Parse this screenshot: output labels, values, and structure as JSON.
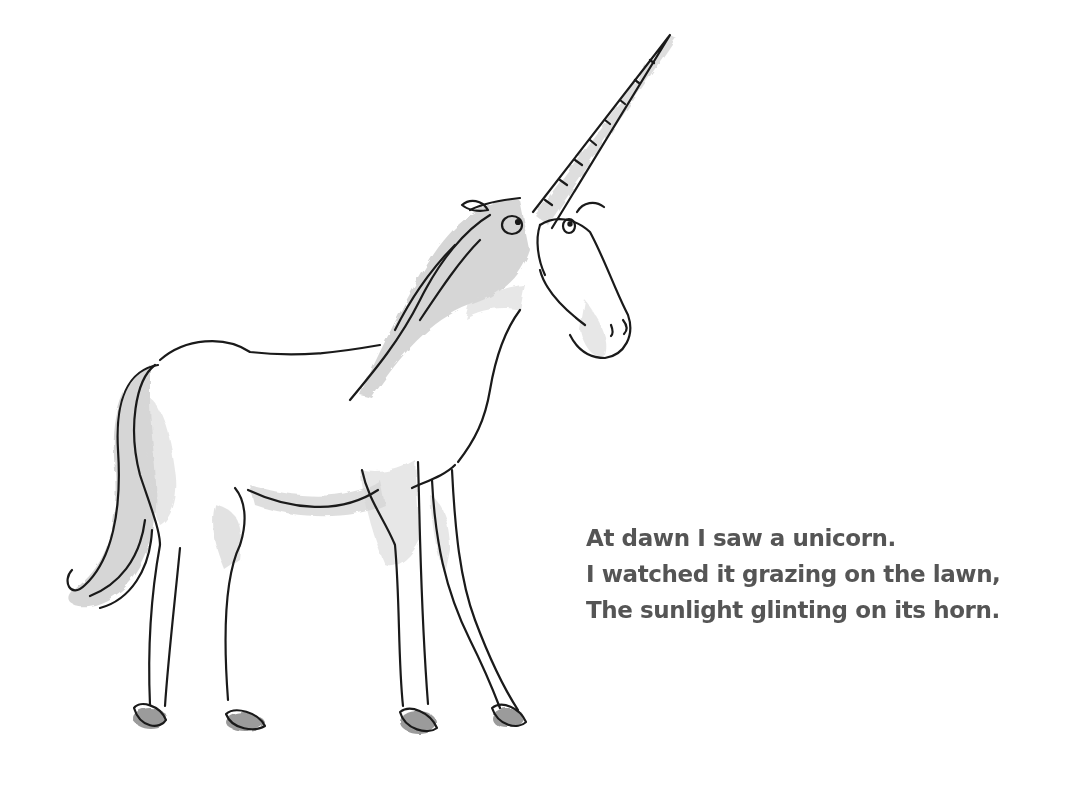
{
  "page": {
    "background": "#ffffff",
    "text_color": "#555555",
    "ink_color": "#1a1a1a",
    "wash_color": "#c4c4c4"
  },
  "illustration": {
    "subject": "unicorn",
    "description": "Ink-and-watercolor drawing of a unicorn standing side-on, facing right, with a long spiral horn"
  },
  "poem": {
    "lines": [
      "At dawn I saw a unicorn.",
      "I watched it grazing on the lawn,",
      "The sunlight glinting on its horn."
    ]
  }
}
